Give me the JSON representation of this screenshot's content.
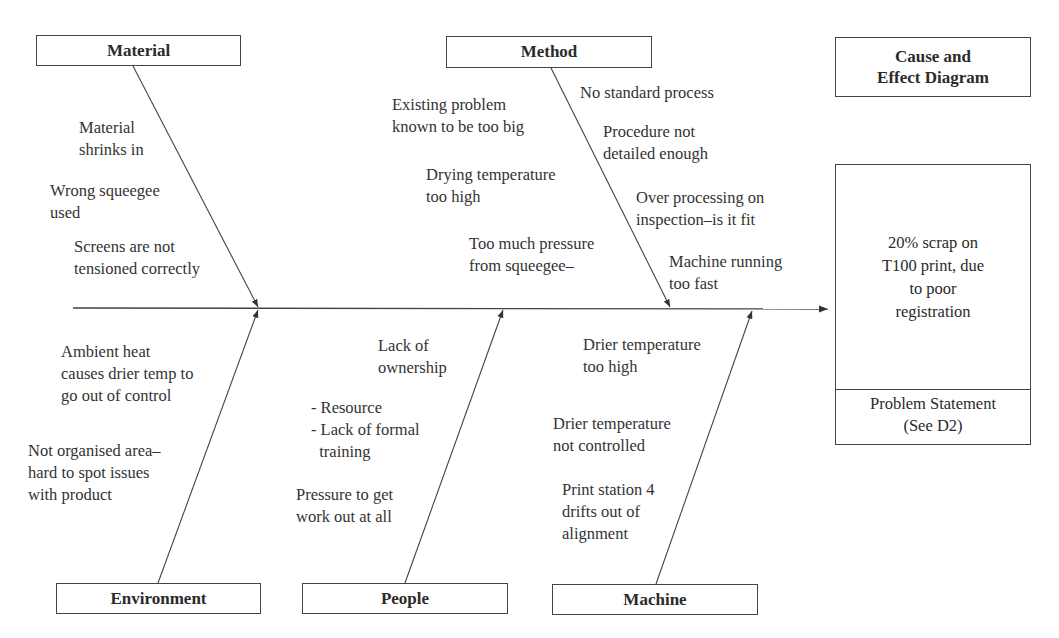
{
  "diagram": {
    "type": "fishbone",
    "title": "Cause and\nEffect Diagram",
    "title_lines": [
      "Cause and",
      "Effect Diagram"
    ],
    "effect": {
      "text_lines": [
        "20% scrap on",
        "T100 print, due",
        "to poor",
        "registration"
      ],
      "footer_lines": [
        "Problem Statement",
        "(See D2)"
      ]
    },
    "categories": {
      "material": {
        "label": "Material",
        "causes": [
          "Material\nshrinks in",
          "Wrong squeegee\nused",
          "Screens are not\ntensioned correctly"
        ]
      },
      "method": {
        "label": "Method",
        "causes_left": [
          "Existing problem\nknown to be too big",
          "Drying temperature\ntoo high",
          "Too much pressure\nfrom squeegee–"
        ],
        "causes_right": [
          "No standard process",
          "Procedure not\ndetailed enough",
          "Over processing on\ninspection–is it fit",
          "Machine running\ntoo fast"
        ]
      },
      "environment": {
        "label": "Environment",
        "causes": [
          "Ambient heat\ncauses drier temp to\ngo out of control",
          "Not organised area–\nhard to spot issues\nwith product"
        ]
      },
      "people": {
        "label": "People",
        "causes": [
          "Lack of\nownership",
          "- Resource\n- Lack of formal\n  training",
          "Pressure to get\nwork out at all"
        ]
      },
      "machine": {
        "label": "Machine",
        "causes": [
          "Drier temperature\ntoo high",
          "Drier temperature\nnot controlled",
          "Print station 4\ndrifts out of\nalignment"
        ]
      }
    }
  },
  "colors": {
    "line": "#444444",
    "text": "#2b2b2b",
    "background": "#ffffff"
  }
}
